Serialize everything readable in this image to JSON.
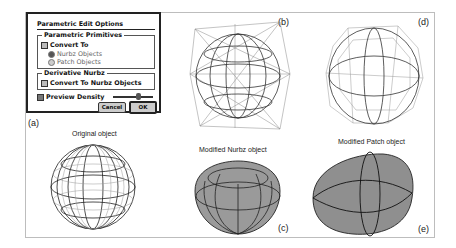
{
  "dialog": {
    "title": "Parametric Edit Options",
    "groups": [
      {
        "label": "Parametric Primitives",
        "checkbox": "Convert To",
        "radios": [
          {
            "label": "Nurbz Objects",
            "selected": true
          },
          {
            "label": "Patch Objects",
            "selected": false
          }
        ]
      },
      {
        "label": "Derivative Nurbz",
        "checkbox": "Convert To Nurbz Objects"
      }
    ],
    "preview_density": "Preview Density",
    "cancel_label": "Cancel",
    "ok_label": "OK"
  },
  "panels": {
    "a": {
      "label": "(a)",
      "caption": "Original object"
    },
    "b": {
      "label": "(b)"
    },
    "c": {
      "label": "(c)",
      "caption": "Modified Nurbz object"
    },
    "d": {
      "label": "(d)"
    },
    "e": {
      "label": "(e)",
      "caption": "Modified Patch object"
    }
  }
}
